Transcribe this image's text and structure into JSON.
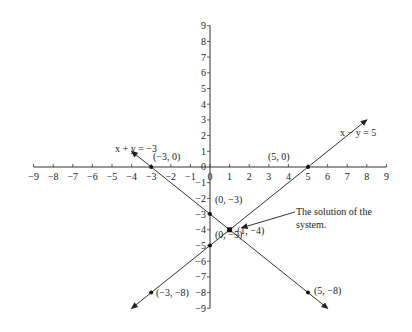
{
  "chart_data": {
    "type": "line",
    "title": "",
    "xlabel": "",
    "ylabel": "",
    "xlim": [
      -9,
      9
    ],
    "ylim": [
      -9,
      9
    ],
    "grid": false,
    "x_ticks": [
      -9,
      -8,
      -7,
      -6,
      -5,
      -4,
      -3,
      -2,
      -1,
      0,
      1,
      2,
      3,
      4,
      5,
      6,
      7,
      8,
      9
    ],
    "y_ticks": [
      -9,
      -8,
      -7,
      -6,
      -5,
      -4,
      -3,
      -2,
      -1,
      0,
      1,
      2,
      3,
      4,
      5,
      6,
      7,
      8,
      9
    ],
    "x_tick_labels": [
      "−9",
      "−8",
      "−7",
      "−6",
      "−5",
      "−4",
      "−3",
      "−2",
      "−1",
      "0",
      "1",
      "2",
      "3",
      "4",
      "5",
      "6",
      "7",
      "8",
      "9"
    ],
    "y_tick_labels": [
      "−9",
      "−8",
      "−7",
      "−6",
      "−5",
      "−4",
      "−3",
      "−2",
      "−1",
      "0",
      "1",
      "2",
      "3",
      "4",
      "5",
      "6",
      "7",
      "8",
      "9"
    ],
    "series": [
      {
        "name": "x − y = 5",
        "label": "x − y = 5",
        "x_range": [
          -4,
          8
        ],
        "slope": 1,
        "intercept": -5,
        "arrows": "both",
        "points": [
          {
            "x": 5,
            "y": 0,
            "label": "(5, 0)"
          },
          {
            "x": 0,
            "y": -5,
            "label": "(0, −5)"
          },
          {
            "x": -3,
            "y": -8,
            "label": "(−3, −8)"
          }
        ]
      },
      {
        "name": "x + y = −3",
        "label": "x + y = −3",
        "x_range": [
          -4,
          6
        ],
        "slope": -1,
        "intercept": -3,
        "arrows": "both",
        "points": [
          {
            "x": -3,
            "y": 0,
            "label": "(−3, 0)"
          },
          {
            "x": 0,
            "y": -3,
            "label": "(0, −3)"
          },
          {
            "x": 5,
            "y": -8,
            "label": "(5, −8)"
          }
        ]
      }
    ],
    "solution": {
      "x": 1,
      "y": -4,
      "label": "(1, −4)"
    },
    "annotations": [
      {
        "text_lines": [
          "The solution of the",
          "system."
        ],
        "points_to": [
          1,
          -4
        ]
      }
    ]
  }
}
